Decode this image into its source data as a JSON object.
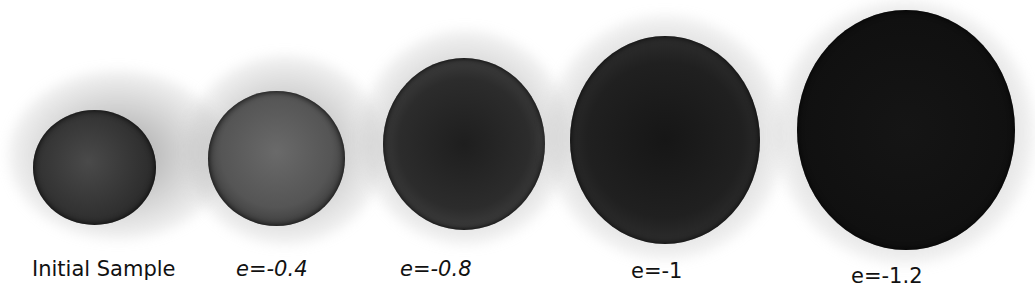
{
  "figure": {
    "samples": [
      {
        "label": "Initial Sample",
        "color": "#2a2a2a",
        "fill": "#3a3a3a"
      },
      {
        "label": "e=-0.4",
        "color": "#3c3c3c",
        "fill": "#5a5a5a"
      },
      {
        "label": "e=-0.8",
        "color": "#1e1e1e",
        "fill": "#2e2e2e"
      },
      {
        "label": "e=-1",
        "color": "#141414",
        "fill": "#222222"
      },
      {
        "label": "e=-1.2",
        "color": "#0c0c0c",
        "fill": "#141414"
      }
    ]
  }
}
